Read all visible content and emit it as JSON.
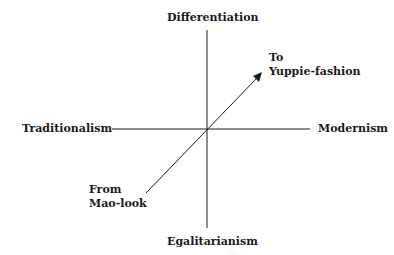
{
  "diagram": {
    "axes": {
      "top": "Differentiation",
      "bottom": "Egalitarianism",
      "left": "Traditionalism",
      "right": "Modernism"
    },
    "arrow": {
      "start_label_line1": "From",
      "start_label_line2": "Mao-look",
      "end_label_line1": "To",
      "end_label_line2": "Yuppie-fashion"
    },
    "colors": {
      "line": "#1a1a1a",
      "background": "#ffffff"
    }
  }
}
